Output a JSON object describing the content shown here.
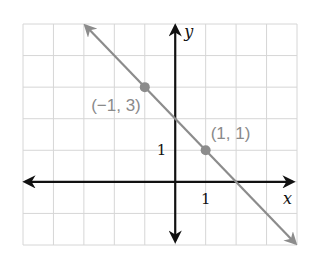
{
  "chart_data": {
    "type": "line",
    "title": "",
    "xlabel": "x",
    "ylabel": "y",
    "xlim": [
      -5,
      4
    ],
    "ylim": [
      -2,
      5
    ],
    "grid": true,
    "grid_step": 1,
    "tick_labels": [
      {
        "axis": "x",
        "value": 1,
        "text": "1"
      },
      {
        "axis": "y",
        "value": 1,
        "text": "1"
      }
    ],
    "series": [
      {
        "name": "line",
        "equation": "y = -x + 2",
        "x": [
          -2.95,
          3.95
        ],
        "y": [
          4.95,
          -1.95
        ],
        "color": "#8c8c8c",
        "arrows": "both"
      }
    ],
    "points": [
      {
        "x": -1,
        "y": 3,
        "label": "(−1, 3)",
        "label_position": "below-left"
      },
      {
        "x": 1,
        "y": 1,
        "label": "(1, 1)",
        "label_position": "above-right"
      }
    ],
    "colors": {
      "axes": "#111111",
      "line": "#8c8c8c",
      "grid": "#d6d6d6",
      "labels": "#8a8a8a"
    }
  }
}
